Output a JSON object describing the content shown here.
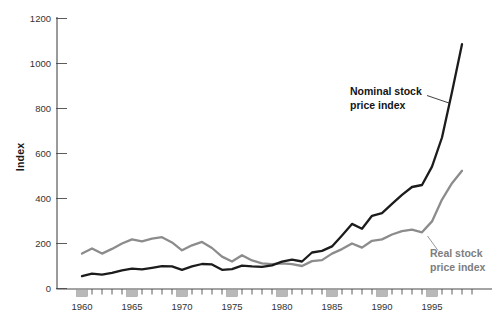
{
  "chart_data": {
    "type": "line",
    "title": "",
    "ylabel": "Index",
    "xlabel": "",
    "grid": false,
    "legend": "inline-annotations-with-leader-lines",
    "ylim": [
      0,
      1200
    ],
    "y_ticks": [
      0,
      200,
      400,
      600,
      800,
      1000,
      1200
    ],
    "x_major_ticks": [
      1960,
      1965,
      1970,
      1975,
      1980,
      1985,
      1990,
      1995
    ],
    "x_minor_tick_range": [
      1960,
      1999
    ],
    "x": [
      1960,
      1961,
      1962,
      1963,
      1964,
      1965,
      1966,
      1967,
      1968,
      1969,
      1970,
      1971,
      1972,
      1973,
      1974,
      1975,
      1976,
      1977,
      1978,
      1979,
      1980,
      1981,
      1982,
      1983,
      1984,
      1985,
      1986,
      1987,
      1988,
      1989,
      1990,
      1991,
      1992,
      1993,
      1994,
      1995,
      1996,
      1997,
      1998
    ],
    "series": [
      {
        "name": "Real stock price index",
        "label_line1": "Real stock",
        "label_line2": "price index",
        "color": "#8c8c8c",
        "values": [
          155,
          178,
          155,
          176,
          200,
          218,
          210,
          222,
          228,
          205,
          170,
          192,
          207,
          180,
          142,
          120,
          148,
          125,
          112,
          108,
          112,
          108,
          100,
          122,
          126,
          155,
          175,
          200,
          182,
          212,
          218,
          240,
          255,
          262,
          250,
          298,
          395,
          468,
          523
        ]
      },
      {
        "name": "Nominal stock price index",
        "label_line1": "Nominal stock",
        "label_line2": "price index",
        "color": "#1c1c1c",
        "values": [
          55,
          66,
          62,
          70,
          81,
          88,
          85,
          92,
          99,
          98,
          83,
          98,
          109,
          107,
          83,
          86,
          102,
          98,
          96,
          103,
          119,
          128,
          120,
          160,
          167,
          187,
          236,
          287,
          266,
          323,
          335,
          376,
          416,
          451,
          460,
          542,
          671,
          873,
          1086
        ]
      }
    ],
    "axis_color": "#4a4a4a",
    "tick_label_color": "#333333",
    "major_tick_box_fill": "#b9b9b9",
    "major_tick_box_stroke": "#8f8f8f"
  }
}
